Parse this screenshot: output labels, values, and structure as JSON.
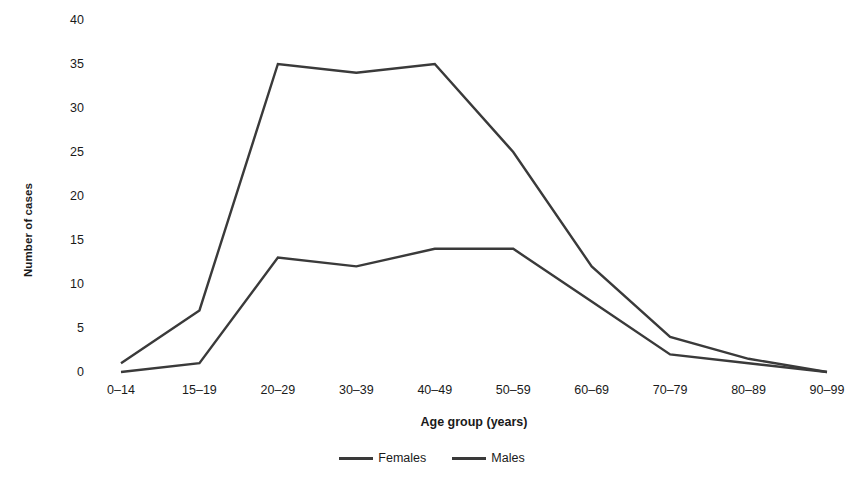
{
  "chart_data": {
    "type": "line",
    "title": "",
    "subtitle": "",
    "xlabel": "Age group (years)",
    "ylabel": "Number of cases",
    "categories": [
      "0–14",
      "15–19",
      "20–29",
      "30–39",
      "40–49",
      "50–59",
      "60–69",
      "70–79",
      "80–89",
      "90–99"
    ],
    "series": [
      {
        "name": "Females",
        "color": "#3a3a3a",
        "values": [
          1,
          7,
          35,
          34,
          35,
          25,
          12,
          4,
          1.5,
          0
        ]
      },
      {
        "name": "Males",
        "color": "#3a3a3a",
        "values": [
          0,
          1,
          13,
          12,
          14,
          14,
          8,
          2,
          1,
          0
        ]
      }
    ],
    "ylim": [
      0,
      40
    ],
    "yticks": [
      0,
      5,
      10,
      15,
      20,
      25,
      30,
      35,
      40
    ],
    "ytick_labels": [
      "0",
      "5",
      "10",
      "15",
      "20",
      "25",
      "30",
      "35",
      "40"
    ],
    "grid": false,
    "legend_position": "bottom",
    "background_color": "#ffffff",
    "line_color": "#3a3a3a",
    "line_width": 2.4
  },
  "axes": {
    "y_title": "Number of cases",
    "x_title": "Age group (years)"
  },
  "legend": {
    "entries": [
      {
        "label": "Females",
        "swatch": "line-swatch-females"
      },
      {
        "label": "Males",
        "swatch": "line-swatch-males"
      }
    ]
  }
}
